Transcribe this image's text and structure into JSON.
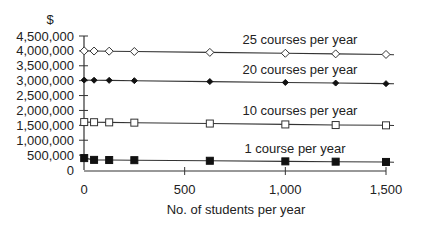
{
  "chart_data": {
    "type": "line",
    "title": "",
    "xlabel": "No. of students per year",
    "ylabel": "$",
    "xlim": [
      0,
      1500
    ],
    "ylim": [
      0,
      4500000
    ],
    "x_ticks": [
      0,
      500,
      1000,
      1500
    ],
    "x_tick_labels": [
      "0",
      "500",
      "1,000",
      "1,500"
    ],
    "y_ticks": [
      0,
      500000,
      1000000,
      1500000,
      2000000,
      2500000,
      3000000,
      3500000,
      4000000,
      4500000
    ],
    "y_tick_labels": [
      "0",
      "500,000",
      "1,000,000",
      "1,500,000",
      "2,000,000",
      "2,500,000",
      "3,000,000",
      "3,500,000",
      "4,000,000",
      "4,500,000"
    ],
    "grid": false,
    "legend_position": "inline labels above each line",
    "x": [
      1,
      50,
      125,
      250,
      625,
      1000,
      1250,
      1500
    ],
    "series": [
      {
        "name": "25 courses per year",
        "marker": "diamond-open",
        "values": [
          4000000,
          3995000,
          3990000,
          3980000,
          3950000,
          3920000,
          3900000,
          3880000
        ]
      },
      {
        "name": "20 courses per year",
        "marker": "diamond-filled",
        "values": [
          3020000,
          3015000,
          3010000,
          3000000,
          2970000,
          2940000,
          2920000,
          2900000
        ]
      },
      {
        "name": "10 courses per year",
        "marker": "square-open",
        "values": [
          1610000,
          1605000,
          1600000,
          1590000,
          1560000,
          1530000,
          1510000,
          1500000
        ]
      },
      {
        "name": "1 course per year",
        "marker": "square-filled",
        "values": [
          400000,
          340000,
          335000,
          330000,
          310000,
          290000,
          280000,
          270000
        ]
      }
    ]
  }
}
